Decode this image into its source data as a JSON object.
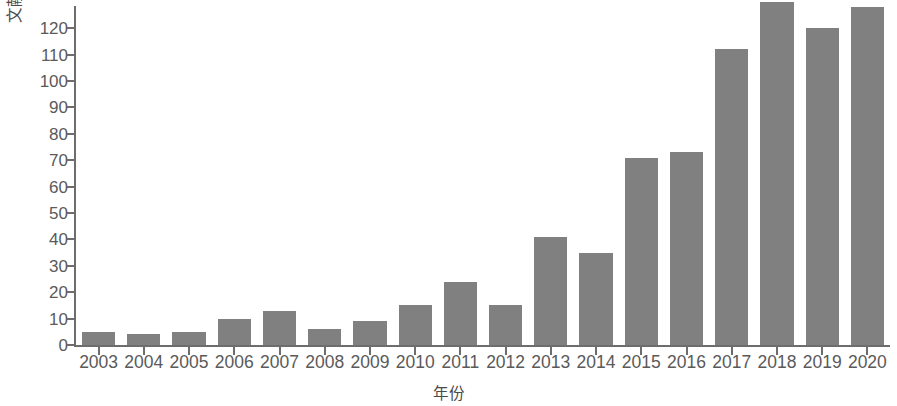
{
  "chart_data": {
    "type": "bar",
    "title": "",
    "subtitle": "",
    "xlabel": "年份",
    "ylabel": "文献数量（篇）",
    "categories": [
      "2003",
      "2004",
      "2005",
      "2006",
      "2007",
      "2008",
      "2009",
      "2010",
      "2011",
      "2012",
      "2013",
      "2014",
      "2015",
      "2016",
      "2017",
      "2018",
      "2019",
      "2020"
    ],
    "values": [
      5,
      4,
      5,
      10,
      13,
      6,
      9,
      15,
      24,
      15,
      41,
      35,
      71,
      73,
      112,
      130,
      120,
      128
    ],
    "series": [
      {
        "name": "文献数量",
        "values": [
          5,
          4,
          5,
          10,
          13,
          6,
          9,
          15,
          24,
          15,
          41,
          35,
          71,
          73,
          112,
          130,
          120,
          128
        ]
      }
    ],
    "ylim": [
      0,
      129
    ],
    "yticks": [
      0,
      10,
      20,
      30,
      40,
      50,
      60,
      70,
      80,
      90,
      100,
      110,
      120
    ],
    "ytick_labels": [
      "0",
      "10",
      "20",
      "30",
      "40",
      "50",
      "60",
      "70",
      "80",
      "90",
      "100",
      "110",
      "120"
    ],
    "grid": false,
    "legend": null,
    "legend_position": "none",
    "bar_color": "#808080",
    "axis_color": "#6d6d6d",
    "text_color": "#5a5a5a",
    "background": "#ffffff",
    "annotations": []
  }
}
